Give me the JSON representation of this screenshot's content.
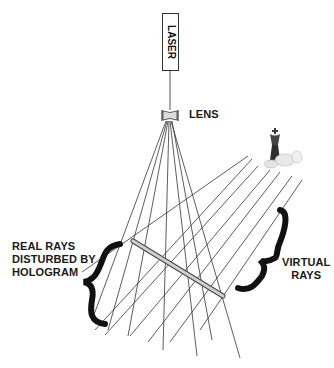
{
  "diagram": {
    "labels": {
      "laser": "LASER",
      "lens": "LENS",
      "real_rays": [
        "REAL RAYS",
        "DISTURBED BY",
        "HOLOGRAM"
      ],
      "virtual_rays": [
        "VIRTUAL",
        "RAYS"
      ]
    },
    "colors": {
      "line": "#333333",
      "brace": "#111111",
      "hologram_plate": "#c8c8c8",
      "background": "#ffffff"
    },
    "components": [
      "laser",
      "lens",
      "hologram plate",
      "virtual chess object (king and pawn)"
    ]
  }
}
